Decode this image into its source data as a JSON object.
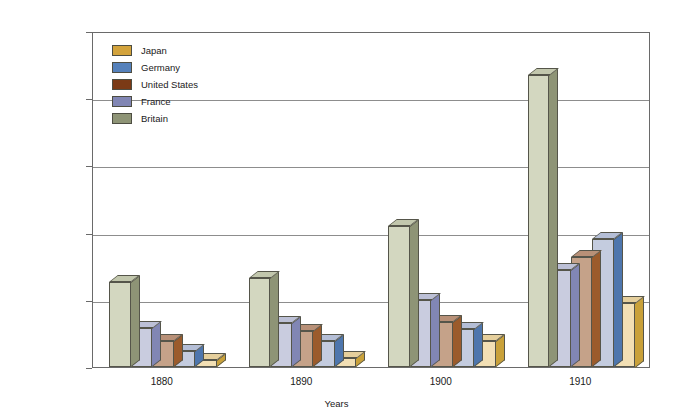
{
  "chart_data": {
    "type": "bar",
    "title": "",
    "subtitle": "",
    "xlabel": "Years",
    "ylabel": "Warship tonnage",
    "categories": [
      "1880",
      "1890",
      "1900",
      "1910"
    ],
    "ylim": [
      0,
      2500000
    ],
    "ytick_values": [
      0,
      500000,
      1000000,
      1500000,
      2000000,
      2500000
    ],
    "ytick_labels": [
      "",
      "500,000",
      "1,000,000",
      "1,500,000",
      "2,000,000",
      "2,500,000"
    ],
    "grid": "horizontal",
    "legend_position": "top-left-inside",
    "style": "3d-bars",
    "series": [
      {
        "name": "Britain",
        "color": "#8e9476",
        "front_color": "#d3d7c0",
        "side_color": "#8e9476",
        "top_color": "#c2c7ad",
        "values": [
          630000,
          660000,
          1050000,
          2175000
        ]
      },
      {
        "name": "France",
        "color": "#8186b4",
        "front_color": "#c9ccdf",
        "side_color": "#8186b4",
        "top_color": "#bcc0d6",
        "values": [
          290000,
          330000,
          500000,
          725000
        ]
      },
      {
        "name": "United States",
        "color": "#7b3a16",
        "front_color": "#c5a289",
        "side_color": "#9b5b2c",
        "top_color": "#b89077",
        "values": [
          195000,
          265000,
          335000,
          820000
        ]
      },
      {
        "name": "Germany",
        "color": "#5581bb",
        "front_color": "#c4ccdf",
        "side_color": "#4e76ad",
        "top_color": "#b4bed6",
        "values": [
          120000,
          195000,
          285000,
          950000
        ]
      },
      {
        "name": "Japan",
        "color": "#d3a33c",
        "front_color": "#f2dfb4",
        "side_color": "#c9a13a",
        "top_color": "#e5cf9c",
        "values": [
          55000,
          70000,
          190000,
          480000
        ]
      }
    ]
  },
  "legend": {
    "items": [
      {
        "label": "Japan"
      },
      {
        "label": "Germany"
      },
      {
        "label": "United States"
      },
      {
        "label": "France"
      },
      {
        "label": "Britain"
      }
    ]
  }
}
